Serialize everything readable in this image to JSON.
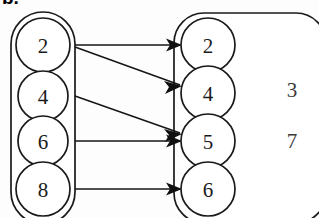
{
  "figure": {
    "caption_fragment": "b.",
    "type": "set-mapping-diagram",
    "background_color": "#fdfdfd",
    "line_color": "#151515"
  },
  "domain_set": {
    "name": "left-set",
    "shape": "rounded-oval",
    "elements": [
      {
        "label": "2"
      },
      {
        "label": "4"
      },
      {
        "label": "6"
      },
      {
        "label": "8"
      }
    ]
  },
  "codomain_set": {
    "name": "right-set",
    "shape": "rounded-rectangle",
    "circled_elements": [
      {
        "label": "2"
      },
      {
        "label": "4"
      },
      {
        "label": "5"
      },
      {
        "label": "6"
      }
    ],
    "loose_elements": [
      {
        "label": "3"
      },
      {
        "label": "7"
      }
    ]
  },
  "mappings": [
    {
      "from": "2",
      "to": "2"
    },
    {
      "from": "2",
      "to": "4"
    },
    {
      "from": "4",
      "to": "5"
    },
    {
      "from": "6",
      "to": "5"
    },
    {
      "from": "8",
      "to": "6"
    }
  ]
}
